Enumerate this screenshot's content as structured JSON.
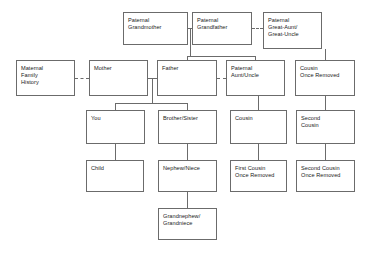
{
  "diagram": {
    "type": "family-tree",
    "background_color": "#ffffff",
    "box_border_color": "#6b6b6b",
    "line_color": "#6b6b6b",
    "text_color": "#1a1a1a",
    "nodes": [
      {
        "id": "paternal-grandmother",
        "label": "Paternal\nGrandmother",
        "x": 123,
        "y": 12,
        "w": 65,
        "h": 33,
        "generation": 1
      },
      {
        "id": "paternal-grandfather",
        "label": "Paternal\nGrandfather",
        "x": 192,
        "y": 12,
        "w": 60,
        "h": 33,
        "generation": 1
      },
      {
        "id": "paternal-great-aunt-uncle",
        "label": "Paternal\nGreat-Aunt/\nGreat-Uncle",
        "x": 263,
        "y": 12,
        "w": 59,
        "h": 37,
        "generation": 1
      },
      {
        "id": "maternal-family-history",
        "label": "Maternal\nFamily\nHistory",
        "x": 16,
        "y": 60,
        "w": 59,
        "h": 36,
        "generation": 2
      },
      {
        "id": "mother",
        "label": "Mother",
        "x": 89,
        "y": 60,
        "w": 59,
        "h": 36,
        "generation": 2
      },
      {
        "id": "father",
        "label": "Father",
        "x": 157,
        "y": 60,
        "w": 60,
        "h": 36,
        "generation": 2
      },
      {
        "id": "paternal-aunt-uncle",
        "label": "Paternal\nAunt/Uncle",
        "x": 226,
        "y": 60,
        "w": 59,
        "h": 36,
        "generation": 2
      },
      {
        "id": "cousin-once-removed",
        "label": "Cousin\nOnce Removed",
        "x": 295,
        "y": 60,
        "w": 60,
        "h": 36,
        "generation": 2
      },
      {
        "id": "you",
        "label": "You",
        "x": 86,
        "y": 110,
        "w": 59,
        "h": 34,
        "generation": 3
      },
      {
        "id": "brother-sister",
        "label": "Brother/Sister",
        "x": 158,
        "y": 110,
        "w": 59,
        "h": 34,
        "generation": 3
      },
      {
        "id": "cousin",
        "label": "Cousin",
        "x": 230,
        "y": 110,
        "w": 57,
        "h": 34,
        "generation": 3
      },
      {
        "id": "second-cousin",
        "label": "Second\nCousin",
        "x": 296,
        "y": 110,
        "w": 59,
        "h": 34,
        "generation": 3
      },
      {
        "id": "child",
        "label": "Child",
        "x": 86,
        "y": 160,
        "w": 58,
        "h": 32,
        "generation": 4
      },
      {
        "id": "nephew-niece",
        "label": "Nephew/Niece",
        "x": 158,
        "y": 160,
        "w": 59,
        "h": 32,
        "generation": 4
      },
      {
        "id": "first-cousin-once-removed",
        "label": "First Cousin\nOnce Removed",
        "x": 230,
        "y": 160,
        "w": 57,
        "h": 32,
        "generation": 4
      },
      {
        "id": "second-cousin-once-removed",
        "label": "Second Cousin\nOnce Removed",
        "x": 296,
        "y": 160,
        "w": 59,
        "h": 32,
        "generation": 4
      },
      {
        "id": "grandnephew-grandniece",
        "label": "Grandnephew/\nGrandniece",
        "x": 158,
        "y": 208,
        "w": 59,
        "h": 32,
        "generation": 5
      }
    ],
    "edges": [
      {
        "id": "grandmother-grandfather-marriage",
        "style": "solid",
        "from": "paternal-grandmother",
        "to": "paternal-grandfather"
      },
      {
        "id": "grandfather-greataunt-sibling",
        "style": "dashed",
        "from": "paternal-grandfather",
        "to": "paternal-great-aunt-uncle"
      },
      {
        "id": "grandparents-to-father",
        "style": "solid",
        "from": "paternal-grandparents",
        "to": "father"
      },
      {
        "id": "grandparents-to-paternal-aunt",
        "style": "solid",
        "from": "paternal-grandparents",
        "to": "paternal-aunt-uncle"
      },
      {
        "id": "greataunt-to-cousin-once-removed",
        "style": "solid",
        "from": "paternal-great-aunt-uncle",
        "to": "cousin-once-removed"
      },
      {
        "id": "maternal-history-to-mother",
        "style": "dashed",
        "from": "maternal-family-history",
        "to": "mother"
      },
      {
        "id": "mother-father-marriage",
        "style": "solid",
        "from": "mother",
        "to": "father"
      },
      {
        "id": "father-paternal-aunt-sibling",
        "style": "dashed",
        "from": "father",
        "to": "paternal-aunt-uncle"
      },
      {
        "id": "parents-to-you",
        "style": "solid",
        "from": "parents",
        "to": "you"
      },
      {
        "id": "parents-to-brother-sister",
        "style": "solid",
        "from": "parents",
        "to": "brother-sister"
      },
      {
        "id": "paternal-aunt-to-cousin",
        "style": "solid",
        "from": "paternal-aunt-uncle",
        "to": "cousin"
      },
      {
        "id": "cousin-once-removed-to-second",
        "style": "solid",
        "from": "cousin-once-removed",
        "to": "second-cousin"
      },
      {
        "id": "you-to-child",
        "style": "solid",
        "from": "you",
        "to": "child"
      },
      {
        "id": "brother-sister-to-nephew-niece",
        "style": "solid",
        "from": "brother-sister",
        "to": "nephew-niece"
      },
      {
        "id": "cousin-to-first-cousin-once",
        "style": "solid",
        "from": "cousin",
        "to": "first-cousin-once-removed"
      },
      {
        "id": "second-cousin-to-once-removed",
        "style": "solid",
        "from": "second-cousin",
        "to": "second-cousin-once-removed"
      },
      {
        "id": "nephew-to-grandnephew",
        "style": "solid",
        "from": "nephew-niece",
        "to": "grandnephew-grandniece"
      }
    ]
  }
}
